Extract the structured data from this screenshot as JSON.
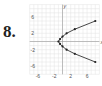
{
  "problem_number": "8.",
  "chart_data": {
    "type": "scatter",
    "title": "",
    "xlabel": "x",
    "ylabel": "y",
    "xlim": [
      -8,
      9
    ],
    "ylim": [
      -8,
      9
    ],
    "x_ticks": [
      "-6",
      "-2",
      "2",
      "6"
    ],
    "y_ticks": [
      "6",
      "2",
      "-2",
      "-6"
    ],
    "grid": true,
    "connected": true,
    "series": [
      {
        "name": "parabola",
        "points": [
          [
            8,
            5
          ],
          [
            3,
            3
          ],
          [
            1,
            2
          ],
          [
            0,
            1.2
          ],
          [
            -0.6,
            0.6
          ],
          [
            -1,
            0
          ],
          [
            -0.6,
            -0.6
          ],
          [
            0,
            -1.2
          ],
          [
            1,
            -2
          ],
          [
            3,
            -3
          ],
          [
            8,
            -5
          ]
        ]
      }
    ]
  }
}
